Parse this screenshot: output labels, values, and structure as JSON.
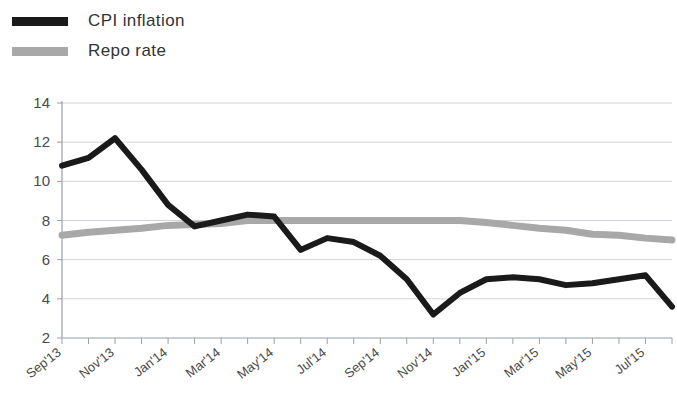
{
  "legend": {
    "position": "top-left",
    "entries": [
      {
        "label": "CPI inflation",
        "color": "#1a1a1a",
        "icon": "line-swatch-icon"
      },
      {
        "label": "Repo rate",
        "color": "#a8a8a8",
        "icon": "line-swatch-icon"
      }
    ]
  },
  "chart_data": {
    "type": "line",
    "title": "",
    "subtitle": "",
    "xlabel": "",
    "ylabel": "",
    "grid": true,
    "legend_position": "top-left",
    "ylim": [
      2,
      14
    ],
    "yticks": [
      2,
      4,
      6,
      8,
      10,
      12,
      14
    ],
    "ytick_labels": [
      "2",
      "4",
      "6",
      "8",
      "10",
      "12",
      "14"
    ],
    "x": [
      "Sep'13",
      "Oct'13",
      "Nov'13",
      "Dec'13",
      "Jan'14",
      "Feb'14",
      "Mar'14",
      "Apr'14",
      "May'14",
      "Jun'14",
      "Jul'14",
      "Aug'14",
      "Sep'14",
      "Oct'14",
      "Nov'14",
      "Dec'14",
      "Jan'15",
      "Feb'15",
      "Mar'15",
      "Apr'15",
      "May'15",
      "Jun'15",
      "Jul'15",
      "Aug'15"
    ],
    "xtick_labels": [
      "Sep'13",
      "Nov'13",
      "Jan'14",
      "Mar'14",
      "May'14",
      "Jul'14",
      "Sep'14",
      "Nov'14",
      "Jan'15",
      "Mar'15",
      "May'15",
      "Jul'15"
    ],
    "xtick_indices": [
      0,
      2,
      4,
      6,
      8,
      10,
      12,
      14,
      16,
      18,
      20,
      22
    ],
    "series": [
      {
        "name": "CPI inflation",
        "color": "#1a1a1a",
        "values": [
          10.8,
          11.2,
          12.2,
          10.6,
          8.8,
          7.7,
          8.0,
          8.3,
          8.2,
          6.5,
          7.1,
          6.9,
          6.2,
          5.0,
          3.2,
          4.3,
          5.0,
          5.1,
          5.0,
          4.7,
          4.8,
          5.0,
          5.2,
          3.6
        ]
      },
      {
        "name": "Repo rate",
        "color": "#a8a8a8",
        "values": [
          7.25,
          7.4,
          7.5,
          7.6,
          7.75,
          7.8,
          7.85,
          8.0,
          8.0,
          8.0,
          8.0,
          8.0,
          8.0,
          8.0,
          8.0,
          8.0,
          7.9,
          7.75,
          7.6,
          7.5,
          7.3,
          7.25,
          7.1,
          7.0
        ]
      }
    ]
  },
  "axes": {
    "y_axis_name": "inflation-rate-percent",
    "x_axis_name": "month-year"
  }
}
